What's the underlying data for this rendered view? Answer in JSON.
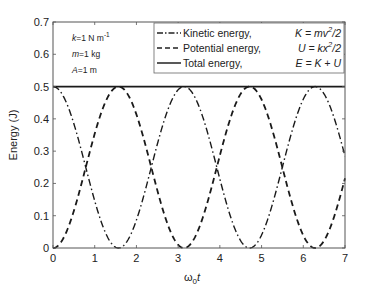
{
  "chart_data": {
    "type": "line",
    "title": "",
    "xlabel": "ω0 t",
    "ylabel": "Energy (J)",
    "xlim": [
      0,
      7
    ],
    "ylim": [
      0,
      0.7
    ],
    "xticks": [
      0,
      1,
      2,
      3,
      4,
      5,
      6,
      7
    ],
    "yticks": [
      0,
      0.1,
      0.2,
      0.3,
      0.4,
      0.5,
      0.6,
      0.7
    ],
    "grid": false,
    "legend_position": "upper right",
    "annotations": [
      "k=1 N m^-1",
      "m=1 kg",
      "A=1 m"
    ],
    "series": [
      {
        "name": "Kinetic energy",
        "formula": "K = mv^2/2",
        "style": "dash-dot",
        "expression": "0.5*cos^2(x)",
        "x": [
          0,
          0.5,
          1,
          1.5708,
          2,
          2.5,
          3,
          3.1416,
          3.5,
          4,
          4.5,
          4.7124,
          5,
          5.5,
          6,
          6.2832,
          6.5,
          7
        ],
        "values": [
          0.5,
          0.385,
          0.146,
          0,
          0.087,
          0.321,
          0.49,
          0.5,
          0.438,
          0.214,
          0.022,
          0,
          0.04,
          0.252,
          0.461,
          0.5,
          0.488,
          0.284
        ]
      },
      {
        "name": "Potential energy",
        "formula": "U = kx^2/2",
        "style": "dashed",
        "expression": "0.5*sin^2(x)",
        "x": [
          0,
          0.5,
          1,
          1.5708,
          2,
          2.5,
          3,
          3.1416,
          3.5,
          4,
          4.5,
          4.7124,
          5,
          5.5,
          6,
          6.2832,
          6.5,
          7
        ],
        "values": [
          0,
          0.115,
          0.354,
          0.5,
          0.413,
          0.179,
          0.01,
          0,
          0.062,
          0.286,
          0.478,
          0.5,
          0.46,
          0.248,
          0.039,
          0,
          0.012,
          0.216
        ]
      },
      {
        "name": "Total energy",
        "formula": "E = K + U",
        "style": "solid",
        "x": [
          0,
          7
        ],
        "values": [
          0.5,
          0.5
        ]
      }
    ]
  },
  "legend": [
    {
      "label": "Kinetic energy,",
      "formula_left": "K = mv",
      "sup": "2",
      "formula_right": "/2"
    },
    {
      "label": "Potential energy,",
      "formula_left": "U = kx",
      "sup": "2",
      "formula_right": "/2"
    },
    {
      "label": "Total energy,",
      "formula_left": "E = K + U",
      "sup": "",
      "formula_right": ""
    }
  ],
  "annotations": {
    "k": "k=1 N m",
    "k_sup": "-1",
    "m": "m=1 kg",
    "A": "A=1 m"
  },
  "axes": {
    "xlabel_main": "ω",
    "xlabel_sub": "0",
    "xlabel_var": "t",
    "ylabel": "Energy (J)",
    "xtick_labels": [
      "0",
      "1",
      "2",
      "3",
      "4",
      "5",
      "6",
      "7"
    ],
    "ytick_labels": [
      "0",
      "0.1",
      "0.2",
      "0.3",
      "0.4",
      "0.5",
      "0.6",
      "0.7"
    ]
  }
}
